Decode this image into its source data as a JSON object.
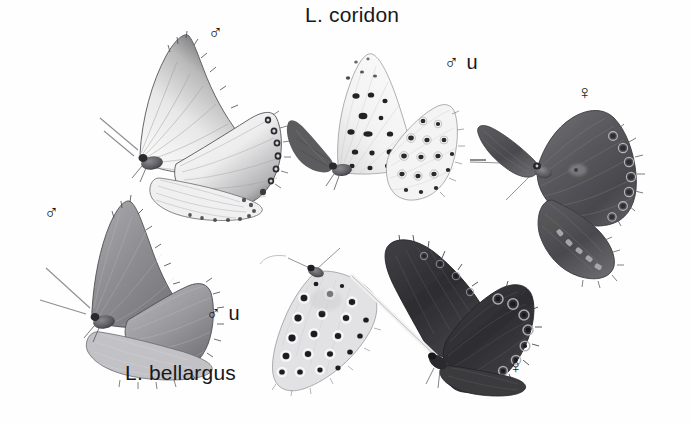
{
  "plate": {
    "width": 693,
    "height": 423,
    "background_color": "#fefefe",
    "ink_color": "#18181a",
    "kind": "grayscale-scientific-illustration",
    "subject": "butterflies"
  },
  "labels": {
    "species_top": "L. coridon",
    "species_bottom": "L. bellargus",
    "male_symbol": "♂",
    "female_symbol": "♀",
    "underside_suffix": "u"
  },
  "specimens": [
    {
      "id": "coridon-male-upperside",
      "species": "L. coridon",
      "sex": "male",
      "view": "upperside",
      "label": "♂",
      "label_x": 215,
      "label_y": 22,
      "tone": "pale silvery-blue with dark borders"
    },
    {
      "id": "coridon-male-underside",
      "species": "L. coridon",
      "sex": "male",
      "view": "underside",
      "label": "♂ u",
      "label_x": 448,
      "label_y": 52,
      "tone": "whitish-grey with black ocelli"
    },
    {
      "id": "coridon-female-upperside",
      "species": "L. coridon",
      "sex": "female",
      "view": "upperside",
      "label": "♀",
      "label_x": 578,
      "label_y": 82,
      "tone": "dark brown with marginal lunules"
    },
    {
      "id": "bellargus-male-upperside",
      "species": "L. bellargus",
      "sex": "male",
      "view": "upperside",
      "label": "♂",
      "label_x": 44,
      "label_y": 202,
      "tone": "mid-grey (blue) with fine dark margin"
    },
    {
      "id": "bellargus-male-underside",
      "species": "L. bellargus",
      "sex": "male",
      "view": "underside",
      "label": "♂ u",
      "label_x": 208,
      "label_y": 303,
      "tone": "pale grey with bold black ocelli"
    },
    {
      "id": "bellargus-female-upperside",
      "species": "L. bellargus",
      "sex": "female",
      "view": "upperside",
      "label": "♀",
      "label_x": 509,
      "label_y": 356,
      "tone": "very dark brown-black with ringed ocelli"
    }
  ],
  "title_positions": {
    "top_x": 305,
    "top_y": 4,
    "bottom_x": 125,
    "bottom_y": 362
  }
}
